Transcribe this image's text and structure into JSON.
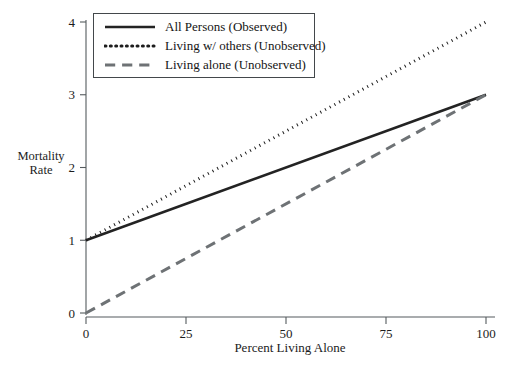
{
  "chart_data": {
    "type": "line",
    "title": "",
    "xlabel": "Percent Living Alone",
    "ylabel_line1": "Mortality",
    "ylabel_line2": "Rate",
    "xlim": [
      0,
      100
    ],
    "ylim": [
      0,
      4
    ],
    "xticks": [
      0,
      25,
      50,
      75,
      100
    ],
    "xtick_labels": [
      "0",
      "25",
      "50",
      "75",
      "100"
    ],
    "yticks": [
      0,
      1,
      2,
      3,
      4
    ],
    "ytick_labels": [
      "0",
      "1",
      "2",
      "3",
      "4"
    ],
    "grid": false,
    "legend_position": "top-left",
    "series": [
      {
        "name": "All Persons (Observed)",
        "style": "solid",
        "color": "#232323",
        "width": 2.6,
        "x": [
          0,
          100
        ],
        "values": [
          1.0,
          3.0
        ]
      },
      {
        "name": "Living w/ others (Unobserved)",
        "style": "dotted",
        "color": "#1d1d1d",
        "width": 3.0,
        "x": [
          0,
          100
        ],
        "values": [
          1.0,
          4.0
        ]
      },
      {
        "name": "Living alone (Unobserved)",
        "style": "dashed",
        "color": "#6e7275",
        "width": 3.0,
        "x": [
          0,
          100
        ],
        "values": [
          0.0,
          3.0
        ]
      }
    ]
  },
  "legend": {
    "entries": [
      {
        "label": "All Persons (Observed)"
      },
      {
        "label": "Living w/ others (Unobserved)"
      },
      {
        "label": "Living alone (Unobserved)"
      }
    ]
  },
  "axes": {
    "x_title": "Percent Living Alone",
    "y_title_line1": "Mortality",
    "y_title_line2": "Rate"
  }
}
